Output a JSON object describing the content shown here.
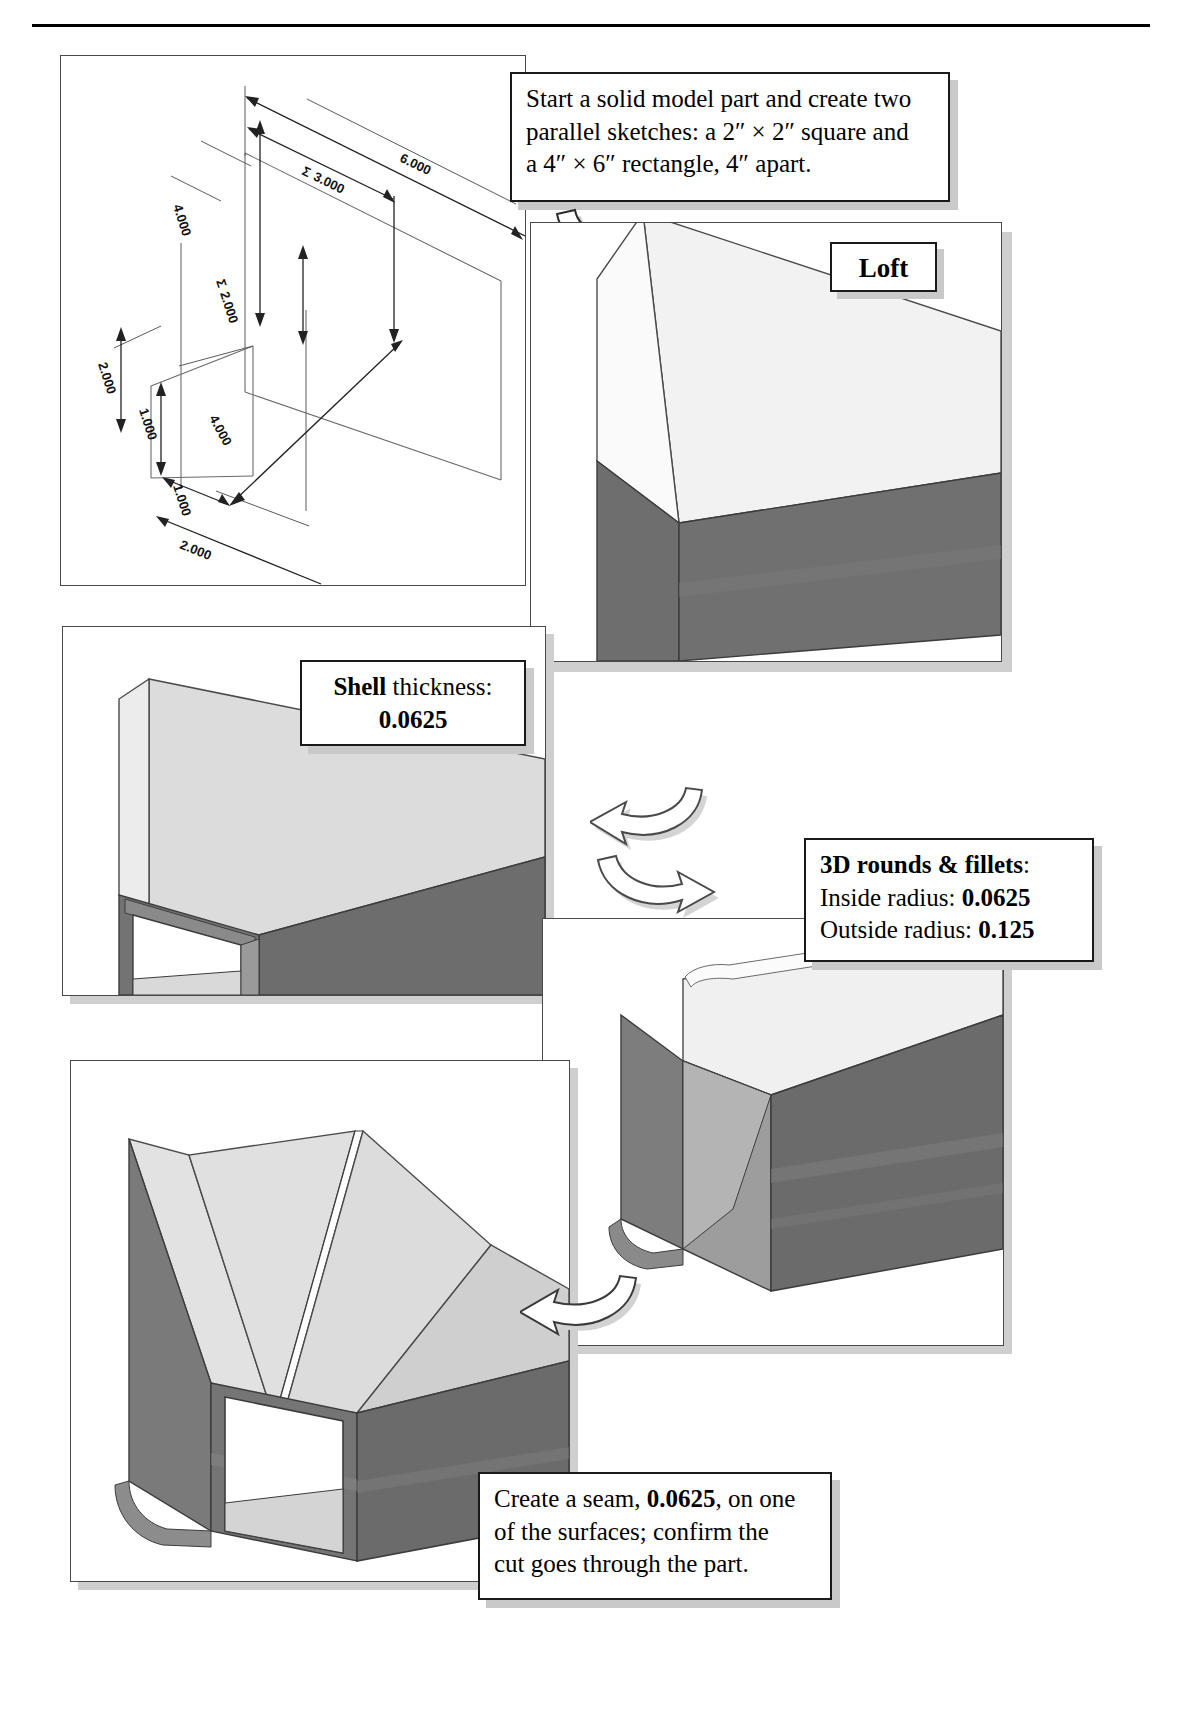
{
  "document": {
    "title": "Loft / Shell / Fillet / Seam modeling tutorial sheet"
  },
  "steps": [
    {
      "id": "step-sketch",
      "callout_lines": [
        "Start a solid model part and create two",
        "parallel sketches: a 2″ × 2″ square and",
        "a 4″ × 6″ rectangle, 4″ apart."
      ]
    },
    {
      "id": "step-loft",
      "label": "Loft"
    },
    {
      "id": "step-shell",
      "line1_bold": "Shell",
      "line1_rest": " thickness:",
      "line2_value": "0.0625"
    },
    {
      "id": "step-fillets",
      "title": "3D rounds & fillets",
      "title_suffix": ":",
      "inside_label": "Inside radius: ",
      "inside_value": "0.0625",
      "outside_label": "Outside radius: ",
      "outside_value": "0.125"
    },
    {
      "id": "step-seam",
      "line1_a": "Create a seam, ",
      "line1_value": "0.0625",
      "line1_b": ", on one",
      "line2": "of the surfaces; confirm the",
      "line3": "cut goes through the part."
    }
  ],
  "dimensions": {
    "top_width": "6.000",
    "top_inner": "3.000",
    "height": "4.000",
    "mid_height": "2.000",
    "base_depth": "4.000",
    "left_height": "2.000",
    "left_inner": "1.000",
    "bottom_inner": "1.000",
    "bottom_width": "2.000",
    "sigma": "Σ"
  },
  "colors": {
    "face_light": "#eeeeee",
    "face_mid": "#d6d6d6",
    "face_dark": "#6e6e6e",
    "face_darker": "#636363",
    "edge": "#3a3a3a",
    "shadow": "#c9c9c9",
    "panel_border": "#4a4a4a"
  }
}
